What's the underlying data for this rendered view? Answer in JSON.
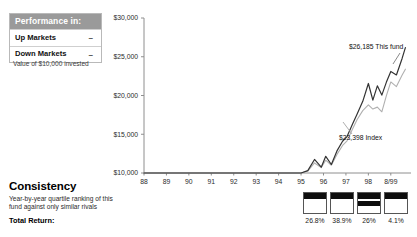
{
  "performance_panel": {
    "header": "Performance in:",
    "rows": [
      {
        "label": "Up Markets",
        "value": "–"
      },
      {
        "label": "Down Markets",
        "value": "–"
      }
    ],
    "caption": "Value of $10,000 invested"
  },
  "consistency": {
    "title": "Consistency",
    "description": "Year-by-year quartile ranking of this fund against only similar rivals",
    "total_return_label": "Total Return:"
  },
  "quartiles": {
    "cells": [
      {
        "percent": "26.8%",
        "bands": [
          {
            "top": 0,
            "height": 30
          }
        ]
      },
      {
        "percent": "38.9%",
        "bands": [
          {
            "top": 0,
            "height": 30
          }
        ]
      },
      {
        "percent": "26%",
        "bands": [
          {
            "top": 0,
            "height": 28
          },
          {
            "top": 40,
            "height": 26
          }
        ]
      },
      {
        "percent": "4.1%",
        "bands": [
          {
            "top": 0,
            "height": 30
          }
        ]
      }
    ]
  },
  "chart_data": {
    "type": "line",
    "title": "",
    "xlabel": "",
    "ylabel": "Value of $10,000 invested",
    "ylim": [
      10000,
      30000
    ],
    "yticks": [
      10000,
      15000,
      20000,
      25000,
      30000
    ],
    "ytick_labels": [
      "$10,000",
      "$15,000",
      "$20,000",
      "$25,000",
      "$30,000"
    ],
    "grid": false,
    "legend_position": "inline-annotation",
    "categories": [
      "88",
      "89",
      "90",
      "91",
      "92",
      "93",
      "94",
      "95",
      "96",
      "97",
      "98",
      "8/99"
    ],
    "xtick_labels": [
      "88",
      "89",
      "90",
      "91",
      "92",
      "93",
      "94",
      "95",
      "96",
      "97",
      "98",
      "8/99"
    ],
    "annotations": [
      {
        "text": "$26,185 This fund",
        "value": 26185,
        "color": "#2b2b2b"
      },
      {
        "text": "$23,398 Index",
        "value": 23398,
        "color": "#9a9a9a"
      }
    ],
    "series": [
      {
        "name": "This fund",
        "color": "#333333",
        "final_value": 26185,
        "x": [
          88.0,
          89.0,
          90.0,
          91.0,
          92.0,
          93.0,
          94.0,
          95.0,
          95.3,
          95.6,
          95.9,
          96.1,
          96.35,
          96.6,
          96.85,
          97.05,
          97.3,
          97.5,
          97.75,
          98.0,
          98.2,
          98.4,
          98.6,
          98.8,
          99.0,
          99.25,
          99.5,
          99.65
        ],
        "values": [
          10000,
          10000,
          10000,
          10000,
          10000,
          10000,
          10000,
          10000,
          10300,
          11750,
          10750,
          12150,
          11100,
          12850,
          14100,
          14700,
          16350,
          17600,
          19250,
          21550,
          19400,
          21250,
          20050,
          21700,
          23100,
          22650,
          24750,
          26185
        ]
      },
      {
        "name": "Index",
        "color": "#b0b0b0",
        "final_value": 23398,
        "x": [
          88.0,
          89.0,
          90.0,
          91.0,
          92.0,
          93.0,
          94.0,
          95.0,
          95.3,
          95.6,
          95.9,
          96.1,
          96.35,
          96.6,
          96.85,
          97.05,
          97.3,
          97.5,
          97.75,
          98.0,
          98.2,
          98.4,
          98.6,
          98.8,
          99.0,
          99.25,
          99.5,
          99.65
        ],
        "values": [
          10000,
          10000,
          10000,
          10000,
          10000,
          10000,
          10000,
          10000,
          10250,
          11300,
          10700,
          11650,
          11000,
          12400,
          13550,
          14150,
          15700,
          16900,
          18050,
          18800,
          18250,
          18500,
          17900,
          19950,
          21750,
          21150,
          22600,
          23398
        ]
      }
    ]
  }
}
